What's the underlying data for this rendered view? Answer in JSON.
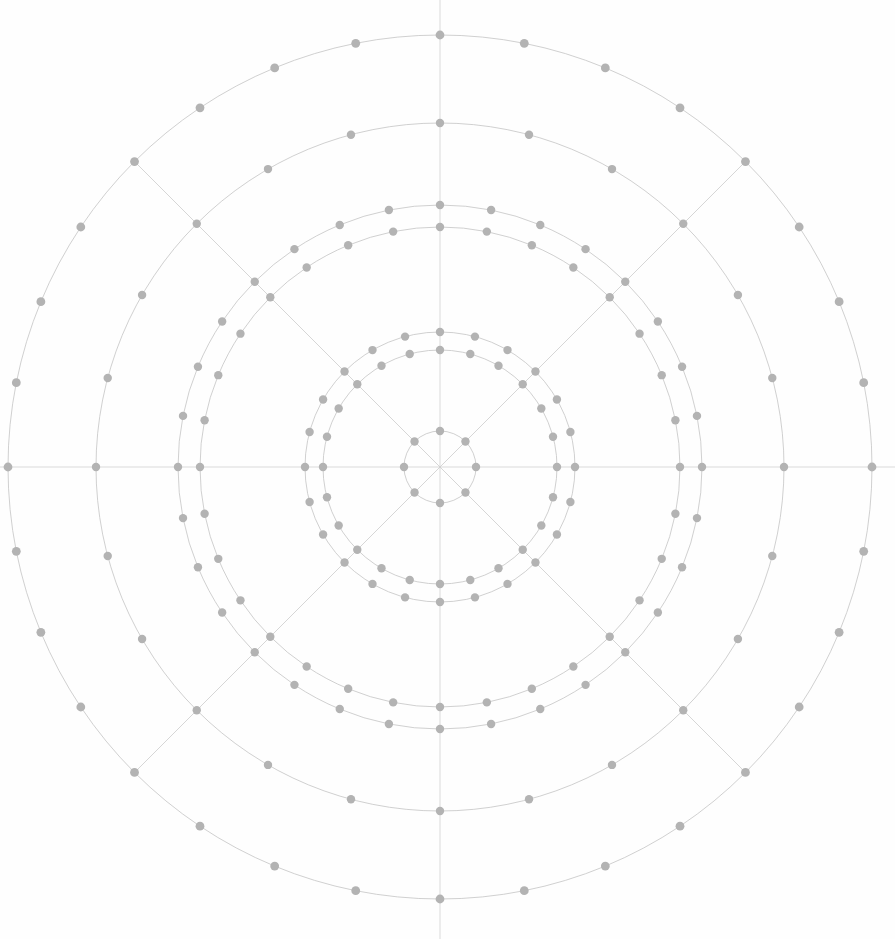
{
  "figure": {
    "type": "polar-grid-diagram",
    "width": 895,
    "height": 939,
    "background_color": "#fefefe"
  },
  "colors": {
    "background": "#fefefe",
    "ring_stroke": "#c4c4c4",
    "spoke_stroke": "#cccccc",
    "axis_stroke": "#d2d2d2",
    "dot_fill": "#b3b3b3"
  },
  "chart_data": {
    "type": "scatter",
    "subtitle": "",
    "xlabel": "",
    "ylabel": "",
    "coordinate_system": "polar",
    "grid": true,
    "legend": "none",
    "center": {
      "x": 440,
      "y": 467
    },
    "xlim": [
      -440,
      455
    ],
    "ylim": [
      -467,
      472
    ],
    "axis_lines": {
      "horizontal": {
        "y": 467,
        "x_start": 0,
        "x_end": 895
      },
      "vertical": {
        "x": 440,
        "y_start": 0,
        "y_end": 939
      }
    },
    "spoke_angles_deg": [
      0,
      45,
      90,
      135,
      180,
      225,
      270,
      315
    ],
    "spoke_count": 8,
    "spoke_max_radius": 432,
    "ring_count": 7,
    "rings": [
      {
        "index": 0,
        "name": "ring-inner-core",
        "radius": 36,
        "dot_count": 8,
        "angle_step_deg": 45,
        "angle_offset_deg": 0,
        "dot_radius": 4.2,
        "stroke_width": 0.8
      },
      {
        "index": 1,
        "name": "ring-second-inner",
        "radius": 117,
        "dot_count": 24,
        "angle_step_deg": 15,
        "angle_offset_deg": 0,
        "dot_radius": 4.2,
        "stroke_width": 0.8
      },
      {
        "index": 2,
        "name": "ring-second-outer",
        "radius": 135,
        "dot_count": 24,
        "angle_step_deg": 15,
        "angle_offset_deg": 0,
        "dot_radius": 4.2,
        "stroke_width": 0.8
      },
      {
        "index": 3,
        "name": "ring-third-inner",
        "radius": 240,
        "dot_count": 32,
        "angle_step_deg": 11.25,
        "angle_offset_deg": 0,
        "dot_radius": 4.2,
        "stroke_width": 0.8
      },
      {
        "index": 4,
        "name": "ring-third-outer",
        "radius": 262,
        "dot_count": 32,
        "angle_step_deg": 11.25,
        "angle_offset_deg": 0,
        "dot_radius": 4.2,
        "stroke_width": 0.8
      },
      {
        "index": 5,
        "name": "ring-fourth",
        "radius": 344,
        "dot_count": 24,
        "angle_step_deg": 15,
        "angle_offset_deg": 0,
        "dot_radius": 4.2,
        "stroke_width": 0.8
      },
      {
        "index": 6,
        "name": "ring-outermost",
        "radius": 432,
        "dot_count": 32,
        "angle_step_deg": 11.25,
        "angle_offset_deg": 0,
        "dot_radius": 4.4,
        "stroke_width": 0.8
      }
    ],
    "radii_values": [
      36,
      117,
      135,
      240,
      262,
      344,
      432
    ],
    "total_dots": 176
  }
}
